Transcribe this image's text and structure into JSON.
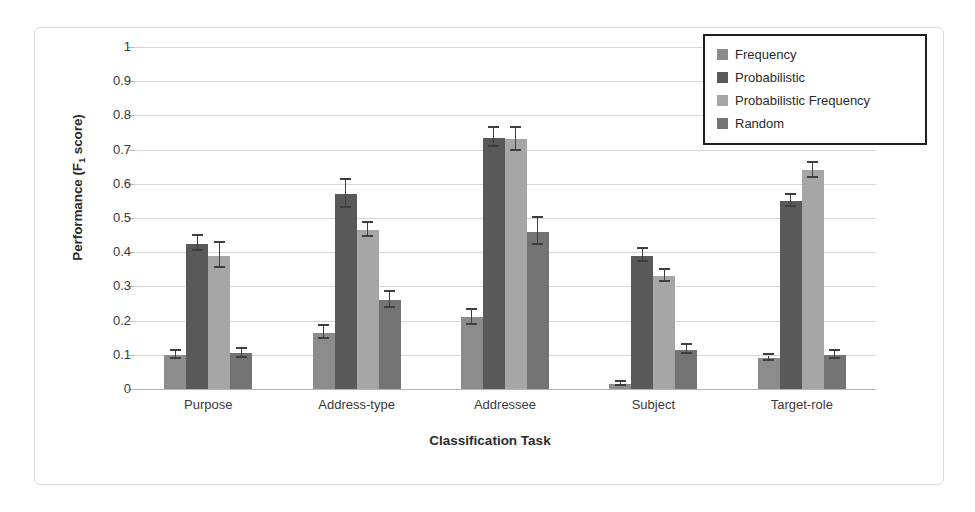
{
  "chart_data": {
    "type": "bar",
    "title": "",
    "xlabel": "Classification Task",
    "ylabel": "Performance (F1 score)",
    "ylabel_base": "Performance (F",
    "ylabel_sub": "1",
    "ylabel_tail": " score)",
    "categories": [
      "Purpose",
      "Address-type",
      "Addressee",
      "Subject",
      "Target-role"
    ],
    "ylim": [
      0,
      1
    ],
    "ytick_labels": [
      "1",
      "0.9",
      "0.8",
      "0.7",
      "0.6",
      "0.5",
      "0.4",
      "0.3",
      "0.2",
      "0.1",
      "0"
    ],
    "ytick_values": [
      1,
      0.9,
      0.8,
      0.7,
      0.6,
      0.5,
      0.4,
      0.3,
      0.2,
      0.1,
      0
    ],
    "grid": true,
    "legend_position": "top-right",
    "series": [
      {
        "name": "Frequency",
        "color": "#8c8c8c",
        "values": [
          0.1,
          0.165,
          0.21,
          0.015,
          0.09
        ],
        "errors": [
          0.012,
          0.018,
          0.022,
          0.006,
          0.008
        ]
      },
      {
        "name": "Probabilistic",
        "color": "#595959",
        "values": [
          0.425,
          0.57,
          0.735,
          0.39,
          0.55
        ],
        "errors": [
          0.022,
          0.042,
          0.028,
          0.018,
          0.018
        ]
      },
      {
        "name": "Probabilistic Frequency",
        "color": "#a6a6a6",
        "values": [
          0.39,
          0.465,
          0.73,
          0.33,
          0.64
        ],
        "errors": [
          0.036,
          0.02,
          0.034,
          0.018,
          0.022
        ]
      },
      {
        "name": "Random",
        "color": "#737373",
        "values": [
          0.105,
          0.26,
          0.46,
          0.115,
          0.1
        ],
        "errors": [
          0.013,
          0.023,
          0.04,
          0.013,
          0.011
        ]
      }
    ]
  },
  "legend": {
    "items": [
      {
        "label": "Frequency",
        "color": "#8c8c8c"
      },
      {
        "label": "Probabilistic",
        "color": "#595959"
      },
      {
        "label": "Probabilistic Frequency",
        "color": "#a6a6a6"
      },
      {
        "label": "Random",
        "color": "#737373"
      }
    ]
  },
  "colors": {
    "grid": "#d6d6d6",
    "axis": "#b5b5b5",
    "text": "#2b2b2b",
    "error_bar": "#3f3f3f",
    "frame": "#d9d9d9"
  }
}
